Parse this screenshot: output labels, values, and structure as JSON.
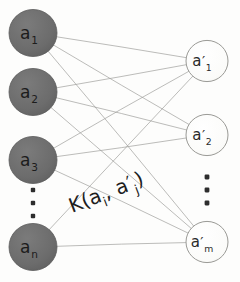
{
  "figure": {
    "background_color": "#fdfdfc",
    "width": 240,
    "height": 282
  },
  "style": {
    "left_node_fill": "#6e6e6e",
    "left_node_stroke": "#5a5a5a",
    "left_node_text_color": "#1c1c1c",
    "right_node_fill": "#fafaf8",
    "right_node_stroke": "#9a9a96",
    "right_node_text_color": "#2a2a2a",
    "edge_color": "#9b9b99",
    "ellipsis_color": "#2d2d2d",
    "kernel_label_color": "#1e1e1e"
  },
  "left_column": {
    "name": "source-nodes",
    "nodes": [
      {
        "id": "a1",
        "base": "a",
        "sub": "1",
        "cx": 33,
        "cy": 33,
        "r": 24
      },
      {
        "id": "a2",
        "base": "a",
        "sub": "2",
        "cx": 33,
        "cy": 92,
        "r": 24
      },
      {
        "id": "a3",
        "base": "a",
        "sub": "3",
        "cx": 33,
        "cy": 160,
        "r": 24
      },
      {
        "id": "an",
        "base": "a",
        "sub": "n",
        "cx": 33,
        "cy": 247,
        "r": 24
      }
    ],
    "ellipsis": {
      "cx": 33,
      "cy": 203,
      "dots": 3,
      "spacing": 13,
      "radius": 2.2
    }
  },
  "right_column": {
    "name": "target-nodes",
    "nodes": [
      {
        "id": "a1p",
        "base": "a",
        "prime": "′",
        "sub": "1",
        "cx": 207,
        "cy": 61,
        "r": 21
      },
      {
        "id": "a2p",
        "base": "a",
        "prime": "′",
        "sub": "2",
        "cx": 207,
        "cy": 135,
        "r": 21
      },
      {
        "id": "amp",
        "base": "a",
        "prime": "′",
        "sub": "m",
        "cx": 207,
        "cy": 242,
        "r": 21
      }
    ],
    "ellipsis": {
      "cx": 207,
      "cy": 190,
      "dots": 3,
      "spacing": 13,
      "radius": 2.4
    }
  },
  "edges": [
    {
      "from": "a1",
      "to": "a1p"
    },
    {
      "from": "a1",
      "to": "a2p"
    },
    {
      "from": "a1",
      "to": "amp"
    },
    {
      "from": "a2",
      "to": "a1p"
    },
    {
      "from": "a2",
      "to": "a2p"
    },
    {
      "from": "a2",
      "to": "amp"
    },
    {
      "from": "a3",
      "to": "a1p"
    },
    {
      "from": "a3",
      "to": "a2p"
    },
    {
      "from": "a3",
      "to": "amp"
    },
    {
      "from": "an",
      "to": "a1p"
    },
    {
      "from": "an",
      "to": "amp"
    }
  ],
  "kernel_label": {
    "text": "K(a",
    "sub_i": "i",
    "comma": ", a",
    "prime": "′",
    "sub_j": "j",
    "close": ")",
    "full_text": "K(aᵢ, a′ⱼ)",
    "x": 72,
    "y": 213,
    "rotation": -21
  }
}
